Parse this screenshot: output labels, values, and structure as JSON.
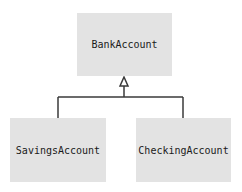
{
  "diagram": {
    "type": "uml-class-inheritance",
    "superclass": {
      "label": "BankAccount"
    },
    "subclasses": [
      {
        "label": "SavingsAccount"
      },
      {
        "label": "CheckingAccount"
      }
    ],
    "relationship": "generalization",
    "colors": {
      "box_fill": "#e3e3e3",
      "line": "#3a3a3a",
      "text": "#1a1a1a"
    }
  }
}
